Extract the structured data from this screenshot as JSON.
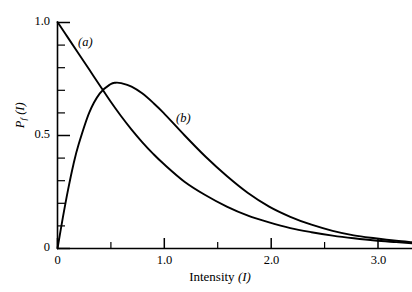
{
  "chart_data": {
    "type": "line",
    "title": "",
    "xlabel": "Intensity (I)",
    "ylabel": "P_f (I)",
    "xlim": [
      0,
      3.35
    ],
    "ylim": [
      0,
      1.0
    ],
    "grid": false,
    "legend_position": "inline-annotations",
    "x_ticks_major": [
      "0",
      "1.0",
      "2.0",
      "3.0"
    ],
    "x_ticks_major_values": [
      0,
      1.0,
      2.0,
      3.0
    ],
    "x_ticks_minor_values": [
      0.5,
      1.5,
      2.5
    ],
    "y_ticks_major": [
      "0",
      "0.5",
      "1.0"
    ],
    "y_ticks_major_values": [
      0,
      0.5,
      1.0
    ],
    "y_ticks_minor_values": [
      0.1,
      0.2,
      0.3,
      0.4,
      0.6,
      0.7,
      0.8,
      0.9
    ],
    "series": [
      {
        "name": "(a)",
        "annotation": "(a)",
        "description": "monotonically decreasing curve starting at P_f = 1.0 at I = 0",
        "x": [
          0.0,
          0.1,
          0.2,
          0.3,
          0.4,
          0.5,
          0.6,
          0.7,
          0.8,
          0.9,
          1.0,
          1.2,
          1.4,
          1.6,
          1.8,
          2.0,
          2.2,
          2.4,
          2.6,
          2.8,
          3.0,
          3.2,
          3.35
        ],
        "y": [
          1.0,
          0.93,
          0.86,
          0.79,
          0.72,
          0.65,
          0.585,
          0.525,
          0.47,
          0.42,
          0.375,
          0.295,
          0.235,
          0.185,
          0.145,
          0.115,
          0.09,
          0.072,
          0.057,
          0.045,
          0.035,
          0.028,
          0.023
        ]
      },
      {
        "name": "(b)",
        "annotation": "(b)",
        "description": "curve rising from 0 to a maximum near I = 0.55 then decaying",
        "x": [
          0.0,
          0.05,
          0.1,
          0.15,
          0.2,
          0.3,
          0.4,
          0.5,
          0.55,
          0.6,
          0.7,
          0.8,
          0.9,
          1.0,
          1.2,
          1.4,
          1.6,
          1.8,
          2.0,
          2.2,
          2.4,
          2.6,
          2.8,
          3.0,
          3.2,
          3.35
        ],
        "y": [
          0.0,
          0.135,
          0.26,
          0.37,
          0.46,
          0.6,
          0.685,
          0.725,
          0.732,
          0.73,
          0.715,
          0.685,
          0.645,
          0.6,
          0.5,
          0.405,
          0.32,
          0.245,
          0.185,
          0.14,
          0.105,
          0.078,
          0.058,
          0.045,
          0.034,
          0.028
        ]
      }
    ],
    "peak_b": {
      "x": 0.55,
      "y": 0.73
    },
    "crossing_point": {
      "x": 0.38,
      "y": 0.72
    },
    "colors": {
      "axis": "#000000",
      "curve": "#000000",
      "background": "#ffffff"
    }
  },
  "axis_titles": {
    "x": "Intensity (I)",
    "x_word": "Intensity",
    "x_symbol": "(I)",
    "y_symbol": "P",
    "y_subscript": "f",
    "y_arg": "(I)"
  },
  "labels": {
    "curve_a": "(a)",
    "curve_b": "(b)",
    "y0": "0",
    "y05": "0.5",
    "y10": "1.0",
    "x0": "0",
    "x10": "1.0",
    "x20": "2.0",
    "x30": "3.0"
  }
}
